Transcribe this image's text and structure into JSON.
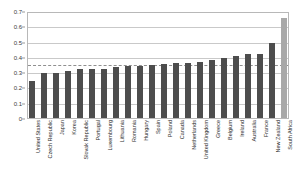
{
  "chart_data": {
    "type": "bar",
    "title": "",
    "subtitle": "",
    "xlabel": "",
    "ylabel": "",
    "ylim": [
      0,
      0.7
    ],
    "ytick_values": [
      0,
      0.1,
      0.2,
      0.3,
      0.4,
      0.5,
      0.6,
      0.7
    ],
    "ytick_labels": [
      "0",
      "0.1",
      "0.2",
      "0.3",
      "0.4",
      "0.5",
      "0.6",
      "0.7"
    ],
    "grid": true,
    "grid_axis": "y",
    "legend": null,
    "legend_position": "none",
    "bar_color": "#4d4d4d",
    "highlight_color": "#a8a8a8",
    "reference_line": {
      "value": 0.355,
      "style": "dashed",
      "color": "#8f8f8f",
      "label": ""
    },
    "categories": [
      "United States",
      "Czech Republic",
      "Japan",
      "Korea",
      "Slovak Republic",
      "Portugal",
      "Luxembourg",
      "Lithuania",
      "Romania",
      "Hungary",
      "Spain",
      "Poland",
      "Canada",
      "Netherlands",
      "United Kingdom",
      "Greece",
      "Belgium",
      "Ireland",
      "Australia",
      "France",
      "New Zealand",
      "South Africa"
    ],
    "values": [
      0.25,
      0.3,
      0.3,
      0.315,
      0.325,
      0.33,
      0.33,
      0.34,
      0.345,
      0.35,
      0.355,
      0.36,
      0.365,
      0.37,
      0.375,
      0.385,
      0.4,
      0.415,
      0.425,
      0.43,
      0.5,
      0.67
    ],
    "highlight_categories": [
      "South Africa"
    ]
  }
}
